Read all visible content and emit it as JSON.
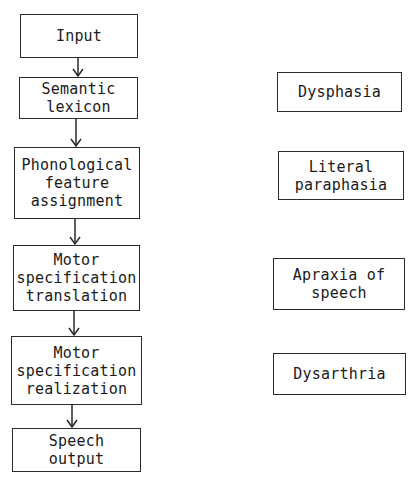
{
  "diagram": {
    "type": "flowchart",
    "process_column": [
      {
        "id": "input",
        "lines": [
          "Input"
        ]
      },
      {
        "id": "semantic-lexicon",
        "lines": [
          "Semantic",
          "lexicon"
        ]
      },
      {
        "id": "phonological-feature-assignment",
        "lines": [
          "Phonological",
          "feature",
          "assignment"
        ]
      },
      {
        "id": "motor-specification-translation",
        "lines": [
          "Motor",
          "specification",
          "translation"
        ]
      },
      {
        "id": "motor-specification-realization",
        "lines": [
          "Motor",
          "specification",
          "realization"
        ]
      },
      {
        "id": "speech-output",
        "lines": [
          "Speech",
          "output"
        ]
      }
    ],
    "disorder_column": [
      {
        "id": "dysphasia",
        "lines": [
          "Dysphasia"
        ]
      },
      {
        "id": "literal-paraphasia",
        "lines": [
          "Literal",
          "paraphasia"
        ]
      },
      {
        "id": "apraxia-of-speech",
        "lines": [
          "Apraxia of",
          "speech"
        ]
      },
      {
        "id": "dysarthria",
        "lines": [
          "Dysarthria"
        ]
      }
    ],
    "edges": [
      [
        "input",
        "semantic-lexicon"
      ],
      [
        "semantic-lexicon",
        "phonological-feature-assignment"
      ],
      [
        "phonological-feature-assignment",
        "motor-specification-translation"
      ],
      [
        "motor-specification-translation",
        "motor-specification-realization"
      ],
      [
        "motor-specification-realization",
        "speech-output"
      ]
    ],
    "colors": {
      "stroke": "#2a2a2a",
      "text": "#1a1a1a",
      "background": "#ffffff"
    }
  }
}
